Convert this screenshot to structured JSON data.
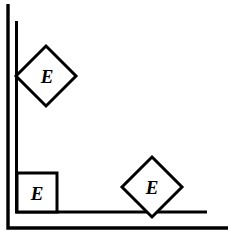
{
  "figure": {
    "background_color": "#ffffff",
    "stroke_color": "#000000",
    "canvas": {
      "width": 239,
      "height": 236
    }
  },
  "triangle": {
    "name": "right-isosceles-triangle",
    "outer": {
      "points": "8,4 8,228 228,228",
      "stroke_width": 3.4
    },
    "inner": {
      "points": "16.5,21 16.5,212 207,212",
      "stroke_width": 3.0
    },
    "vertices": {
      "apex_top_left": {
        "x": 8,
        "y": 4
      },
      "right_angle_bottom_left": {
        "x": 8,
        "y": 228
      },
      "acute_bottom_right": {
        "x": 228,
        "y": 228
      }
    }
  },
  "markers": [
    {
      "id": "angle-marker-top",
      "type": "diamond",
      "label": "E",
      "center": {
        "x": 46,
        "y": 76
      },
      "half_diagonal": 30,
      "stroke_width": 3.0,
      "label_offset_x": 1,
      "label_offset_y": 0
    },
    {
      "id": "angle-marker-bottom-left",
      "type": "square",
      "label": "E",
      "x": 17,
      "y": 173,
      "width": 40,
      "height": 39,
      "stroke_width": 3.0,
      "label_offset_x": 0,
      "label_offset_y": 1
    },
    {
      "id": "angle-marker-bottom-right",
      "type": "diamond",
      "label": "E",
      "center": {
        "x": 152,
        "y": 187
      },
      "half_diagonal": 30,
      "stroke_width": 3.0,
      "label_offset_x": 0,
      "label_offset_y": 0
    }
  ],
  "labels": {
    "top_marker_text": "E",
    "bottom_left_marker_text": "E",
    "bottom_right_marker_text": "E"
  }
}
